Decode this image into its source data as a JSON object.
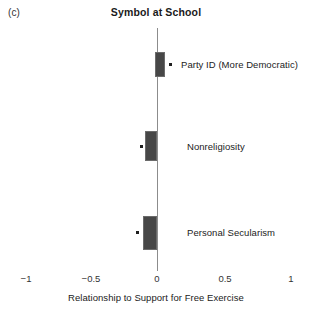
{
  "panel_label": "(c)",
  "title": "Symbol at School",
  "x_axis_title": "Relationship to Support for Free Exercise",
  "accent_color": "#474747",
  "zero_line_color": "#8c8c8c",
  "chart_data": {
    "type": "bar",
    "title": "Symbol at School",
    "subtitle": "(c)",
    "xlabel": "Relationship to Support for Free Exercise",
    "ylabel": "",
    "xlim": [
      -1,
      1
    ],
    "xticks": [
      -1,
      -0.5,
      0,
      0.5,
      1
    ],
    "xtick_labels": [
      "−1",
      "−0.5",
      "0",
      "0.5",
      "1"
    ],
    "grid": false,
    "legend": "none",
    "orientation": "horizontal",
    "zero_reference_line": 0,
    "categories": [
      "Party ID (More Democratic)",
      "Nonreligiosity",
      "Personal Secularism"
    ],
    "series": [
      {
        "name": "Confidence interval",
        "intervals": [
          {
            "low": -0.02,
            "high": 0.06
          },
          {
            "low": -0.09,
            "high": 0.0
          },
          {
            "low": -0.11,
            "high": 0.0
          }
        ]
      },
      {
        "name": "Point estimate",
        "values": [
          0.09,
          -0.12,
          -0.15
        ]
      }
    ],
    "points": [
      {
        "label": "Party ID (More Democratic)",
        "estimate": 0.09,
        "ci_low": -0.02,
        "ci_high": 0.06
      },
      {
        "label": "Nonreligiosity",
        "estimate": -0.12,
        "ci_low": -0.09,
        "ci_high": 0.0
      },
      {
        "label": "Personal Secularism",
        "estimate": -0.15,
        "ci_low": -0.11,
        "ci_high": 0.0
      }
    ]
  },
  "geometry": {
    "rows": [
      {
        "label": "Party ID (More Democratic)",
        "box_left": 155,
        "box_top": 52,
        "box_width": 10,
        "box_height": 25,
        "dot_left": 169,
        "dot_top": 63,
        "label_left": 181,
        "label_top": 59
      },
      {
        "label": "Nonreligiosity",
        "box_left": 145,
        "box_top": 131,
        "box_width": 12,
        "box_height": 30,
        "dot_left": 140,
        "dot_top": 145,
        "label_left": 187,
        "label_top": 141
      },
      {
        "label": "Personal Secularism",
        "box_left": 143,
        "box_top": 216,
        "box_width": 14,
        "box_height": 34,
        "dot_left": 136,
        "dot_top": 231,
        "label_left": 187,
        "label_top": 227
      }
    ],
    "ticks": [
      {
        "label": "−1",
        "x": 26
      },
      {
        "label": "−0.5",
        "x": 91
      },
      {
        "label": "0",
        "x": 157
      },
      {
        "label": "0.5",
        "x": 225
      },
      {
        "label": "1",
        "x": 291
      }
    ]
  }
}
